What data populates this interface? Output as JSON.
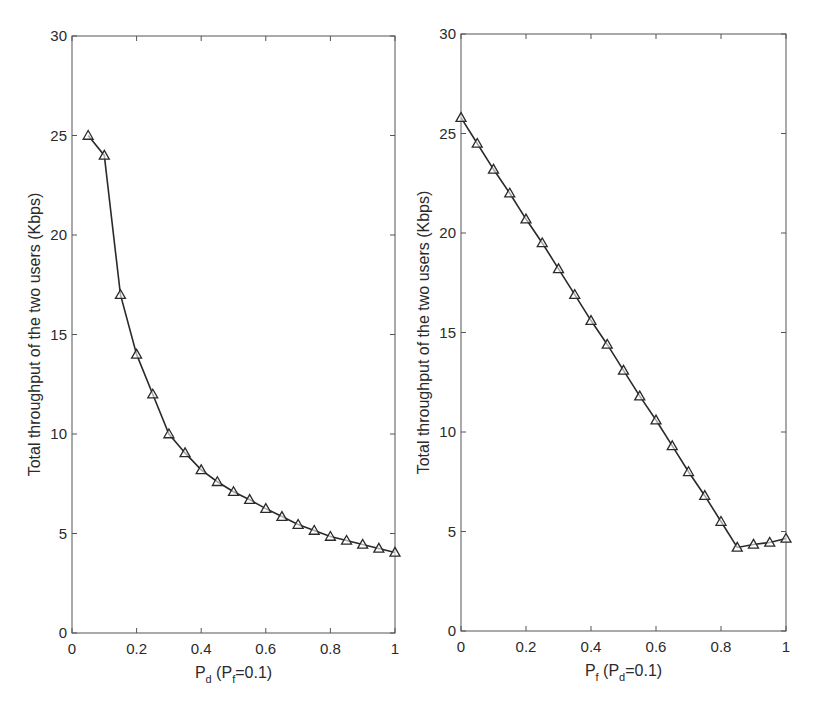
{
  "chart_data": [
    {
      "type": "line",
      "panel": "left",
      "title": "",
      "xlabel": "P_d (P_f=0.1)",
      "xlabel_parts": {
        "main": "P",
        "main_sub": "d",
        "paren_open": " (P",
        "paren_sub": "f",
        "rest": "=0.1)"
      },
      "ylabel": "Total throughput of the two users (Kbps)",
      "xlim": [
        0,
        1
      ],
      "ylim": [
        0,
        30
      ],
      "xticks": [
        "0",
        "0.2",
        "0.4",
        "0.6",
        "0.8",
        "1"
      ],
      "yticks": [
        "0",
        "5",
        "10",
        "15",
        "20",
        "25",
        "30"
      ],
      "grid": false,
      "marker": "triangle",
      "series": [
        {
          "name": "throughput",
          "x": [
            0.05,
            0.1,
            0.15,
            0.2,
            0.25,
            0.3,
            0.35,
            0.4,
            0.45,
            0.5,
            0.55,
            0.6,
            0.65,
            0.7,
            0.75,
            0.8,
            0.85,
            0.9,
            0.95,
            1.0
          ],
          "values": [
            25.0,
            24.0,
            17.0,
            14.0,
            12.0,
            10.0,
            9.05,
            8.2,
            7.6,
            7.1,
            6.7,
            6.25,
            5.85,
            5.45,
            5.15,
            4.85,
            4.65,
            4.45,
            4.25,
            4.05
          ]
        }
      ]
    },
    {
      "type": "line",
      "panel": "right",
      "title": "",
      "xlabel": "P_f (P_d=0.1)",
      "xlabel_parts": {
        "main": "P",
        "main_sub": "f",
        "paren_open": " (P",
        "paren_sub": "d",
        "rest": "=0.1)"
      },
      "ylabel": "Total throughput of the two users (Kbps)",
      "xlim": [
        0,
        1
      ],
      "ylim": [
        0,
        30
      ],
      "xticks": [
        "0",
        "0.2",
        "0.4",
        "0.6",
        "0.8",
        "1"
      ],
      "yticks": [
        "0",
        "5",
        "10",
        "15",
        "20",
        "25",
        "30"
      ],
      "grid": false,
      "marker": "triangle",
      "series": [
        {
          "name": "throughput",
          "x": [
            0,
            0.05,
            0.1,
            0.15,
            0.2,
            0.25,
            0.3,
            0.35,
            0.4,
            0.45,
            0.5,
            0.55,
            0.6,
            0.65,
            0.7,
            0.75,
            0.8,
            0.85,
            0.9,
            0.95,
            1.0
          ],
          "values": [
            25.8,
            24.5,
            23.2,
            22.0,
            20.7,
            19.5,
            18.2,
            16.9,
            15.6,
            14.4,
            13.1,
            11.8,
            10.6,
            9.3,
            8.0,
            6.8,
            5.5,
            4.2,
            4.35,
            4.45,
            4.65
          ]
        }
      ]
    }
  ],
  "colors": {
    "line": "#2a2a2a",
    "axis": "#555555",
    "background": "#ffffff"
  }
}
